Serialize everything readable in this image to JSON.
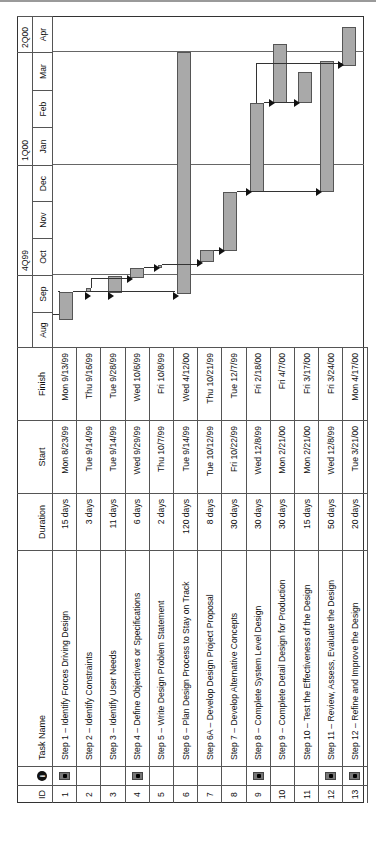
{
  "columns": {
    "id": "ID",
    "indicator": "i",
    "task_name": "Task Name",
    "duration": "Duration",
    "start": "Start",
    "finish": "Finish"
  },
  "timeline": {
    "quarters": [
      {
        "label": "",
        "months": [
          "Aug",
          "Sep"
        ]
      },
      {
        "label": "4Q99",
        "months": [
          "Oct",
          "Nov",
          "Dec"
        ]
      },
      {
        "label": "1Q00",
        "months": [
          "Jan",
          "Feb",
          "Mar"
        ]
      },
      {
        "label": "2Q00",
        "months": [
          "Apr"
        ]
      }
    ],
    "months": [
      "Aug",
      "Sep",
      "Oct",
      "Nov",
      "Dec",
      "Jan",
      "Feb",
      "Mar",
      "Apr"
    ]
  },
  "tasks": [
    {
      "id": "1",
      "indicator": true,
      "name": "Step 1 – Identify Forces Driving Design",
      "duration": "15 days",
      "start": "Mon 8/23/99",
      "finish": "Mon 9/13/99"
    },
    {
      "id": "2",
      "indicator": false,
      "name": "Step 2 – Identify Constraints",
      "duration": "3 days",
      "start": "Tue 9/14/99",
      "finish": "Thu 9/16/99"
    },
    {
      "id": "3",
      "indicator": false,
      "name": "Step 3 – Identify User Needs",
      "duration": "11 days",
      "start": "Tue 9/14/99",
      "finish": "Tue 9/28/99"
    },
    {
      "id": "4",
      "indicator": true,
      "name": "Step 4 – Define Objectives or Specifications",
      "duration": "6 days",
      "start": "Wed 9/29/99",
      "finish": "Wed 10/6/99"
    },
    {
      "id": "5",
      "indicator": false,
      "name": "Step 5 – Write Design Problem Statement",
      "duration": "2 days",
      "start": "Thu 10/7/99",
      "finish": "Fri 10/8/99"
    },
    {
      "id": "6",
      "indicator": false,
      "name": "Step 6 – Plan Design Process to Stay on Track",
      "duration": "120 days",
      "start": "Tue 9/14/99",
      "finish": "Wed 4/12/00"
    },
    {
      "id": "7",
      "indicator": false,
      "name": "Step 6A – Develop Design Project Proposal",
      "duration": "8 days",
      "start": "Tue 10/12/99",
      "finish": "Thu 10/21/99"
    },
    {
      "id": "8",
      "indicator": false,
      "name": "Step 7 – Develop Alternative Concepts",
      "duration": "30 days",
      "start": "Fri 10/22/99",
      "finish": "Tue 12/7/99"
    },
    {
      "id": "9",
      "indicator": true,
      "name": "Step 8 – Complete System Level Design",
      "duration": "30 days",
      "start": "Wed 12/8/99",
      "finish": "Fri 2/18/00"
    },
    {
      "id": "10",
      "indicator": false,
      "name": "Step 9 – Complete Detail Design for Production",
      "duration": "30 days",
      "start": "Mon 2/21/00",
      "finish": "Fri 4/7/00"
    },
    {
      "id": "11",
      "indicator": false,
      "name": "Step 10 – Test the Effectiveness of the Design",
      "duration": "15 days",
      "start": "Mon 2/21/00",
      "finish": "Fri 3/17/00"
    },
    {
      "id": "12",
      "indicator": true,
      "name": "Step 11 – Review, Assess, Evaluate the Design",
      "duration": "50 days",
      "start": "Wed 12/8/99",
      "finish": "Fri 3/24/00"
    },
    {
      "id": "13",
      "indicator": true,
      "name": "Step 12 – Refine and Improve the Design",
      "duration": "20 days",
      "start": "Tue 3/21/00",
      "finish": "Mon 4/17/00"
    }
  ],
  "chart_data": {
    "type": "gantt",
    "title": "",
    "orientation": "rotated 90 degrees counter-clockwise",
    "columns": [
      "ID",
      "Indicators",
      "Task Name",
      "Duration",
      "Start",
      "Finish"
    ],
    "timescale": {
      "major": [
        "3Q99",
        "4Q99",
        "1Q00",
        "2Q00"
      ],
      "major_labels_visible": [
        "4Q99",
        "1Q00",
        "2Q00"
      ],
      "minor": [
        "Aug",
        "Sep",
        "Oct",
        "Nov",
        "Dec",
        "Jan",
        "Feb",
        "Mar",
        "Apr"
      ]
    },
    "categories": [
      "1",
      "2",
      "3",
      "4",
      "5",
      "6",
      "7",
      "8",
      "9",
      "10",
      "11",
      "12",
      "13"
    ],
    "bars": [
      {
        "id": 1,
        "start": "1999-08-23",
        "finish": "1999-09-13",
        "duration_days": 15
      },
      {
        "id": 2,
        "start": "1999-09-14",
        "finish": "1999-09-16",
        "duration_days": 3
      },
      {
        "id": 3,
        "start": "1999-09-14",
        "finish": "1999-09-28",
        "duration_days": 11
      },
      {
        "id": 4,
        "start": "1999-09-29",
        "finish": "1999-10-06",
        "duration_days": 6
      },
      {
        "id": 5,
        "start": "1999-10-07",
        "finish": "1999-10-08",
        "duration_days": 2
      },
      {
        "id": 6,
        "start": "1999-09-14",
        "finish": "2000-04-12",
        "duration_days": 120
      },
      {
        "id": 7,
        "start": "1999-10-12",
        "finish": "1999-10-21",
        "duration_days": 8
      },
      {
        "id": 8,
        "start": "1999-10-22",
        "finish": "1999-12-07",
        "duration_days": 30
      },
      {
        "id": 9,
        "start": "1999-12-08",
        "finish": "2000-02-18",
        "duration_days": 30
      },
      {
        "id": 10,
        "start": "2000-02-21",
        "finish": "2000-04-07",
        "duration_days": 30
      },
      {
        "id": 11,
        "start": "2000-02-21",
        "finish": "2000-03-17",
        "duration_days": 15
      },
      {
        "id": 12,
        "start": "1999-12-08",
        "finish": "2000-03-24",
        "duration_days": 50
      },
      {
        "id": 13,
        "start": "2000-03-21",
        "finish": "2000-04-17",
        "duration_days": 20
      }
    ],
    "dependencies": [
      [
        1,
        2
      ],
      [
        1,
        3
      ],
      [
        1,
        6
      ],
      [
        2,
        4
      ],
      [
        3,
        4
      ],
      [
        4,
        5
      ],
      [
        5,
        7
      ],
      [
        6,
        7
      ],
      [
        7,
        8
      ],
      [
        8,
        9
      ],
      [
        8,
        12
      ],
      [
        9,
        10
      ],
      [
        9,
        11
      ],
      [
        9,
        13
      ]
    ],
    "legend": [],
    "grid": "vertical quarter lines",
    "bar_color": "#a9a9a9"
  }
}
